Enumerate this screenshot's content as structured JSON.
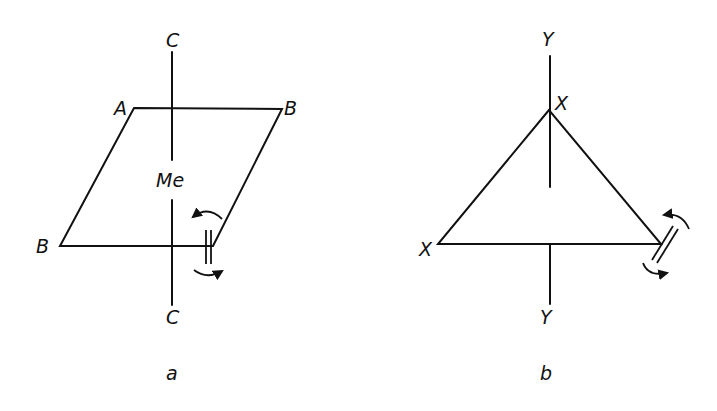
{
  "figure": {
    "panels": [
      {
        "id": "a",
        "caption": "a",
        "shape": "parallelogram",
        "axis_labels": {
          "top": "C",
          "bottom": "C"
        },
        "vertex_labels": {
          "top_left": "A",
          "top_right": "B",
          "bottom_left": "B"
        },
        "center_label": "Me",
        "features": [
          "vertical C-C axis",
          "double bond with rotation arrows at bottom-right vertex"
        ]
      },
      {
        "id": "b",
        "caption": "b",
        "shape": "triangle",
        "axis_labels": {
          "top": "Y",
          "bottom": "Y"
        },
        "vertex_labels": {
          "top": "X",
          "bottom_left": "X"
        },
        "features": [
          "vertical Y-Y axis",
          "double bond with rotation arrows at bottom-right vertex"
        ]
      }
    ],
    "colors": {
      "ink": "#111111",
      "background": "#ffffff"
    }
  }
}
